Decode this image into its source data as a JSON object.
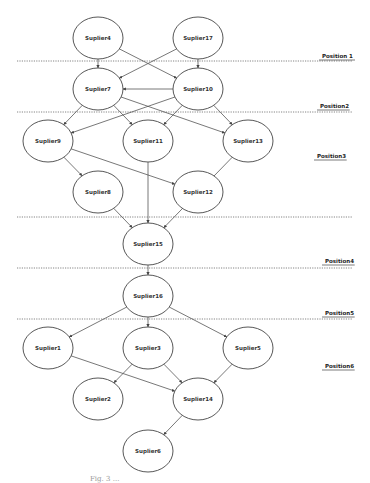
{
  "diagram": {
    "positions": [
      {
        "label": "Position 1",
        "line_y": 61,
        "label_x": 322,
        "label_y": 58
      },
      {
        "label": "Position2",
        "line_y": 112,
        "label_x": 320,
        "label_y": 108
      },
      {
        "label": "Position3",
        "line_y": null,
        "label_x": 317,
        "label_y": 158
      },
      {
        "label": "",
        "line_y": 217,
        "label_x": 0,
        "label_y": 0
      },
      {
        "label": "Position4",
        "line_y": 268,
        "label_x": 325,
        "label_y": 263
      },
      {
        "label": "Position5",
        "line_y": 319,
        "label_x": 325,
        "label_y": 315
      },
      {
        "label": "Position6",
        "line_y": null,
        "label_x": 325,
        "label_y": 368
      }
    ],
    "nodes": [
      {
        "id": "Suplier4",
        "label": "Suplier4",
        "x": 98,
        "y": 38
      },
      {
        "id": "Suplier17",
        "label": "Suplier17",
        "x": 198,
        "y": 38
      },
      {
        "id": "Suplier7",
        "label": "Suplier7",
        "x": 98,
        "y": 89
      },
      {
        "id": "Suplier10",
        "label": "Suplier10",
        "x": 198,
        "y": 89
      },
      {
        "id": "Suplier9",
        "label": "Suplier9",
        "x": 48,
        "y": 141
      },
      {
        "id": "Suplier11",
        "label": "Suplier11",
        "x": 148,
        "y": 141
      },
      {
        "id": "Suplier13",
        "label": "Suplier13",
        "x": 248,
        "y": 141
      },
      {
        "id": "Suplier8",
        "label": "Suplier8",
        "x": 98,
        "y": 192
      },
      {
        "id": "Suplier12",
        "label": "Suplier12",
        "x": 198,
        "y": 192
      },
      {
        "id": "Suplier15",
        "label": "Suplier15",
        "x": 148,
        "y": 244
      },
      {
        "id": "Suplier16",
        "label": "Suplier16",
        "x": 148,
        "y": 296
      },
      {
        "id": "Suplier1",
        "label": "Suplier1",
        "x": 48,
        "y": 348
      },
      {
        "id": "Suplier3",
        "label": "Suplier3",
        "x": 148,
        "y": 348
      },
      {
        "id": "Suplier5",
        "label": "Suplier5",
        "x": 248,
        "y": 348
      },
      {
        "id": "Suplier2",
        "label": "Suplier2",
        "x": 98,
        "y": 399
      },
      {
        "id": "Suplier14",
        "label": "Suplier14",
        "x": 198,
        "y": 399
      },
      {
        "id": "Suplier6",
        "label": "Suplier6",
        "x": 148,
        "y": 451
      }
    ],
    "edges": [
      [
        "Suplier4",
        "Suplier7"
      ],
      [
        "Suplier4",
        "Suplier10"
      ],
      [
        "Suplier17",
        "Suplier7"
      ],
      [
        "Suplier17",
        "Suplier10"
      ],
      [
        "Suplier10",
        "Suplier7"
      ],
      [
        "Suplier7",
        "Suplier9"
      ],
      [
        "Suplier7",
        "Suplier11"
      ],
      [
        "Suplier7",
        "Suplier13"
      ],
      [
        "Suplier10",
        "Suplier9"
      ],
      [
        "Suplier10",
        "Suplier11"
      ],
      [
        "Suplier10",
        "Suplier13"
      ],
      [
        "Suplier9",
        "Suplier8"
      ],
      [
        "Suplier9",
        "Suplier12"
      ],
      [
        "Suplier11",
        "Suplier15"
      ],
      [
        "Suplier8",
        "Suplier15"
      ],
      [
        "Suplier13",
        "Suplier15"
      ],
      [
        "Suplier15",
        "Suplier16"
      ],
      [
        "Suplier16",
        "Suplier1"
      ],
      [
        "Suplier16",
        "Suplier3"
      ],
      [
        "Suplier16",
        "Suplier5"
      ],
      [
        "Suplier1",
        "Suplier14"
      ],
      [
        "Suplier3",
        "Suplier2"
      ],
      [
        "Suplier3",
        "Suplier14"
      ],
      [
        "Suplier5",
        "Suplier14"
      ],
      [
        "Suplier14",
        "Suplier6"
      ]
    ],
    "node_rx": 25,
    "node_ry": 21,
    "colors": {
      "stroke": "#444444",
      "line": "#555555",
      "dotted": "#666666"
    }
  },
  "caption": "Fig. 3 ..."
}
